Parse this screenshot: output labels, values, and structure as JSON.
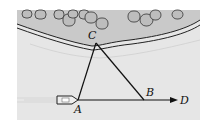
{
  "diagram": {
    "type": "geometry-navigation",
    "points": {
      "A": {
        "label": "A"
      },
      "B": {
        "label": "B"
      },
      "C": {
        "label": "C"
      },
      "D": {
        "label": "D"
      }
    },
    "segments": [
      "AC",
      "BC",
      "AB",
      "BD"
    ],
    "arrow": "A→D",
    "objects": [
      "boat at A",
      "shoreline with trees near C"
    ],
    "colors": {
      "water": "#e4e4e4",
      "shore": "#c8c8c8",
      "lines": "#111111",
      "trees": "#bdbdbd"
    }
  }
}
